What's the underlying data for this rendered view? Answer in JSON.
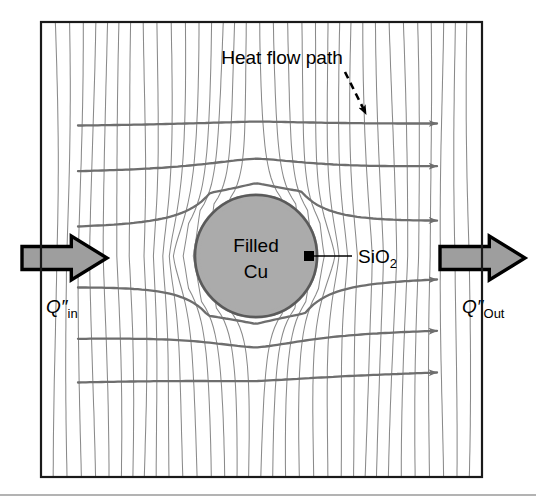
{
  "figure": {
    "type": "heat-flow-diagram",
    "frame": {
      "x": 41,
      "y": 22,
      "width": 441,
      "height": 455
    },
    "baseline_rule_y": 495
  },
  "labels": {
    "heat_flow_path": "Heat flow path",
    "via_line1": "Filled",
    "via_line2": "Cu",
    "liner": "SiO",
    "liner_sub": "2",
    "q_in_symbol": "Q″",
    "q_in_sub": "in",
    "q_out_symbol": "Q″",
    "q_out_sub": "Out"
  },
  "colors": {
    "frame": "#1a1a1a",
    "background": "#ffffff",
    "isotherm": "#8a8a8a",
    "streamline": "#6e6e6e",
    "via_fill": "#ababab",
    "via_ring": "#5a5a5a",
    "via_ring_outer": "#9a9a9a",
    "block_arrow_fill": "#9e9e9e",
    "block_arrow_stroke": "#000000",
    "marker": "#000000",
    "text": "#000000",
    "baseline": "#9a9a9a"
  },
  "via": {
    "cx": 256,
    "cy": 256,
    "radius_fill": 56,
    "radius_ring": 61
  },
  "block_arrows": [
    {
      "name": "q-in-arrow",
      "direction": "right",
      "x": 22,
      "y": 236,
      "width": 85,
      "height": 44
    },
    {
      "name": "q-out-arrow",
      "direction": "right",
      "x": 440,
      "y": 236,
      "width": 85,
      "height": 44
    }
  ],
  "streamlines": {
    "count": 6,
    "y_left": [
      126,
      172,
      228,
      286,
      338,
      382
    ],
    "y_right": [
      124,
      167,
      222,
      278,
      330,
      372
    ],
    "x_start": 78,
    "x_end": 437,
    "deflection": [
      -16,
      -22,
      -34,
      34,
      22,
      16
    ]
  },
  "isotherms": {
    "count": 33,
    "orientation": "near-vertical"
  },
  "annotation_arrow": {
    "name": "heat-flow-pointer",
    "style": "dashed",
    "from": [
      345,
      72
    ],
    "to": [
      366,
      114
    ]
  },
  "leader_line": {
    "name": "sio2-leader",
    "from": [
      309,
      256
    ],
    "to": [
      352,
      256
    ]
  }
}
